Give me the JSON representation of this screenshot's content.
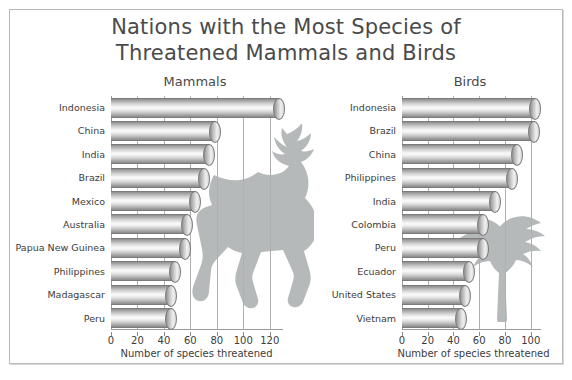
{
  "title": {
    "line1": "Nations with the Most Species of",
    "line2": "Threatened Mammals and Birds"
  },
  "panels": {
    "mammals": {
      "heading": "Mammals",
      "axis_title": "Number of species threatened"
    },
    "birds": {
      "heading": "Birds",
      "axis_title": "Number of species threatened"
    }
  },
  "decor": {
    "deer_silhouette": "deer-silhouette-icon",
    "bird_silhouette": "bird-silhouette-icon"
  },
  "chart_data": [
    {
      "type": "bar",
      "orientation": "horizontal",
      "title": "Mammals",
      "xlabel": "Number of species threatened",
      "ylabel": "",
      "xlim": [
        0,
        130
      ],
      "xticks": [
        0,
        20,
        40,
        60,
        80,
        100,
        120
      ],
      "grid": true,
      "legend": "none",
      "categories": [
        "Indonesia",
        "China",
        "India",
        "Brazil",
        "Mexico",
        "Australia",
        "Papua New Guinea",
        "Philippines",
        "Madagascar",
        "Peru"
      ],
      "values": [
        128,
        79,
        75,
        71,
        64,
        58,
        57,
        49,
        46,
        46
      ]
    },
    {
      "type": "bar",
      "orientation": "horizontal",
      "title": "Birds",
      "xlabel": "Number of species threatened",
      "ylabel": "",
      "xlim": [
        0,
        108
      ],
      "xticks": [
        0,
        20,
        40,
        60,
        80,
        100
      ],
      "grid": true,
      "legend": "none",
      "categories": [
        "Indonesia",
        "Brazil",
        "China",
        "Philippines",
        "India",
        "Colombia",
        "Peru",
        "Ecuador",
        "United States",
        "Vietnam"
      ],
      "values": [
        104,
        103,
        90,
        86,
        73,
        64,
        64,
        53,
        50,
        47
      ]
    }
  ]
}
